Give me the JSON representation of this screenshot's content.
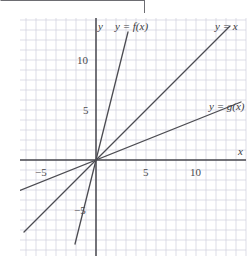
{
  "figure": {
    "width": 251,
    "height": 262,
    "background": "#ffffff",
    "rule_color": "#6d6d72"
  },
  "chart_data": {
    "type": "line",
    "title": "",
    "subtitle": "",
    "xlabel": "x",
    "ylabel": "y",
    "xlim": [
      -7.6,
      14.9
    ],
    "ylim": [
      -9.5,
      14.2
    ],
    "xticks": [
      -5,
      5,
      10
    ],
    "xticklabels": [
      "−5",
      "5",
      "10"
    ],
    "yticks": [
      -5,
      5,
      10
    ],
    "yticklabels": [
      "−5",
      "5",
      "10"
    ],
    "grid": true,
    "grid_spacing_units": 1,
    "grid_color": "#cfcfdc",
    "axis_color": "#4a4a50",
    "line_color": "#4c4c52",
    "legend": "inline-labels",
    "series": [
      {
        "name": "y = f(x)",
        "label": "y = f(x)",
        "slope": 4,
        "intercept": 0,
        "x": [
          -2.1,
          3.2
        ],
        "y": [
          -8.4,
          12.8
        ]
      },
      {
        "name": "y = x",
        "label": "y = x",
        "slope": 1,
        "intercept": 0,
        "x": [
          -7.2,
          13.4
        ],
        "y": [
          -7.2,
          13.4
        ]
      },
      {
        "name": "y = g(x)",
        "label": "y = g(x)",
        "slope": 0.4,
        "intercept": 0,
        "x": [
          -7.6,
          14.5
        ],
        "y": [
          -3.04,
          5.8
        ]
      }
    ],
    "annotations": [
      {
        "text": "y",
        "x": 0.2,
        "y": 13.4,
        "name": "y-axis-label"
      },
      {
        "text": "y = f(x)",
        "x": 1.9,
        "y": 13.4,
        "name": "f-curve-label"
      },
      {
        "text": "y = x",
        "x": 11.9,
        "y": 13.4,
        "name": "x-identity-curve-label"
      },
      {
        "text": "y = g(x)",
        "x": 11.3,
        "y": 5.4,
        "name": "g-curve-label"
      },
      {
        "text": "x",
        "x": 14.2,
        "y": 0.9,
        "name": "x-axis-label"
      }
    ]
  }
}
